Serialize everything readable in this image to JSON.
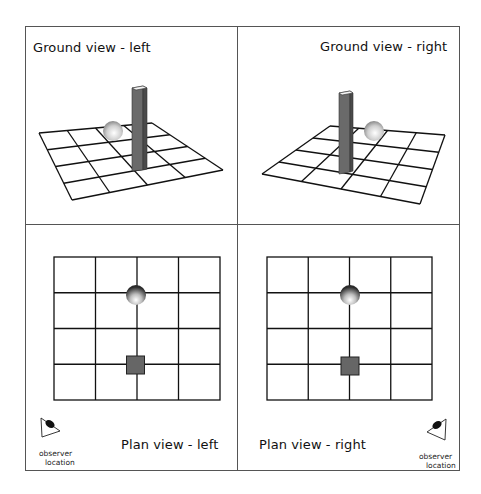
{
  "panels": {
    "ground_left": {
      "title": "Ground view - left"
    },
    "ground_right": {
      "title": "Ground view - right"
    },
    "plan_left": {
      "title": "Plan view - left",
      "observer_label_1": "observer",
      "observer_label_2": "location"
    },
    "plan_right": {
      "title": "Plan view - right",
      "observer_label_1": "observer",
      "observer_label_2": "location"
    }
  },
  "objects": {
    "sphere": "shaded-sphere",
    "pillar": "vertical-pillar",
    "grid": "4x4-grid"
  },
  "colors": {
    "line": "#111111",
    "pillar": "#6a6a6a",
    "pillar_dark": "#4a4a4a",
    "square": "#666666",
    "frame": "#555555"
  }
}
